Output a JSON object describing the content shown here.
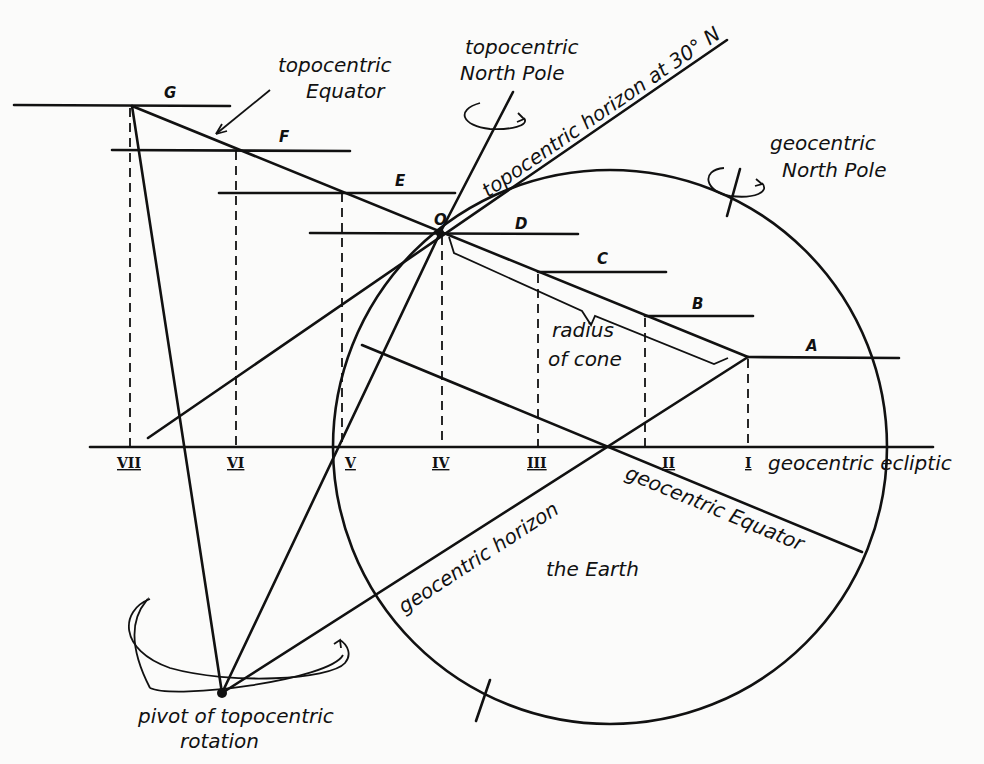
{
  "diagram": {
    "labels": {
      "topocentric_equator": [
        "topocentric",
        "Equator"
      ],
      "topocentric_north_pole": [
        "topocentric",
        "North Pole"
      ],
      "topocentric_horizon": "topocentric horizon at 30° N",
      "geocentric_north_pole": [
        "geocentric",
        "North Pole"
      ],
      "radius_of_cone": [
        "radius",
        "of cone"
      ],
      "geocentric_ecliptic": "geocentric ecliptic",
      "geocentric_equator": "geocentric Equator",
      "geocentric_horizon": "geocentric horizon",
      "the_earth": "the Earth",
      "pivot": [
        "pivot of topocentric",
        "rotation"
      ]
    },
    "points": {
      "origin": "O",
      "A": "A",
      "B": "B",
      "C": "C",
      "D": "D",
      "E": "E",
      "F": "F",
      "G": "G"
    },
    "ecliptic_ticks": [
      "VII",
      "VI",
      "V",
      "IV",
      "III",
      "II",
      "I"
    ]
  }
}
